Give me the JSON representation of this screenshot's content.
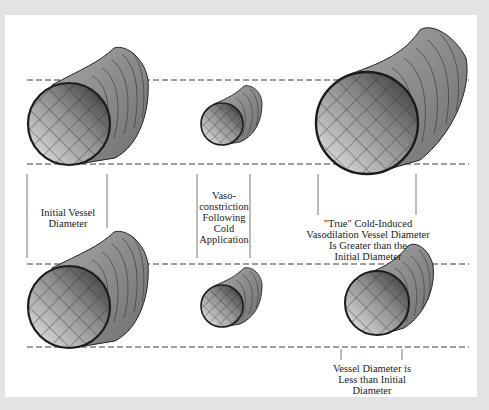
{
  "figure": {
    "background_color": "#e3e3e3",
    "panel_color": "#ffffff",
    "line_color": "#3a3a3a"
  },
  "labels": {
    "initial": [
      "Initial Vessel",
      "Diameter"
    ],
    "vasoconstriction": [
      "Vaso-",
      "constriction",
      "Following",
      "Cold",
      "Application"
    ],
    "true_civd": [
      "\"True\" Cold-Induced",
      "Vasodilation Vessel Diameter",
      "Is Greater than the",
      "Initial Diameter"
    ],
    "less_than": [
      "Vessel Diameter is",
      "Less than Initial",
      "Diameter"
    ]
  },
  "vessels": {
    "top_row": [
      {
        "name": "initial-vessel",
        "size": "large"
      },
      {
        "name": "constricted-vessel",
        "size": "small"
      },
      {
        "name": "true-civd-vessel",
        "size": "extra-large"
      }
    ],
    "bottom_row": [
      {
        "name": "initial-vessel",
        "size": "large"
      },
      {
        "name": "constricted-vessel",
        "size": "small"
      },
      {
        "name": "partial-dilation-vessel",
        "size": "medium"
      }
    ]
  }
}
